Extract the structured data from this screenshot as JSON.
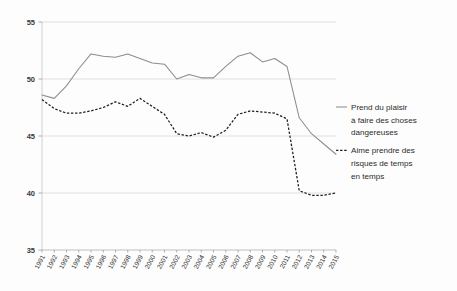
{
  "chart_data": {
    "type": "line",
    "title": "",
    "subtitle": "",
    "xlabel": "",
    "ylabel": "",
    "grid": true,
    "legend_position": "right",
    "ylim": [
      35,
      55
    ],
    "yticks": [
      35,
      40,
      45,
      50,
      55
    ],
    "ytick_labels": [
      "35",
      "40",
      "45",
      "50",
      "55"
    ],
    "x": [
      1991,
      1992,
      1993,
      1994,
      1995,
      1996,
      1997,
      1998,
      1999,
      2000,
      2001,
      2002,
      2003,
      2004,
      2005,
      2006,
      2007,
      2008,
      2009,
      2010,
      2011,
      2012,
      2013,
      2014,
      2015
    ],
    "xtick_labels": [
      "1991",
      "1992",
      "1993",
      "1994",
      "1995",
      "1996",
      "1997",
      "1998",
      "1999",
      "2000",
      "2001",
      "2002",
      "2003",
      "2004",
      "2005",
      "2006",
      "2007",
      "2008",
      "2009",
      "2010",
      "2011",
      "2012",
      "2013",
      "2014",
      "2015"
    ],
    "series": [
      {
        "name": "Prend du plaisir à faire des choses dangereuses",
        "style": "solid",
        "color": "#8d8d8d",
        "values": [
          48.6,
          48.3,
          49.4,
          50.9,
          52.2,
          52.0,
          51.9,
          52.2,
          51.8,
          51.4,
          51.3,
          50.0,
          50.4,
          50.1,
          50.1,
          51.1,
          52.0,
          52.3,
          51.5,
          51.8,
          51.1,
          46.6,
          45.2,
          44.3,
          43.4
        ]
      },
      {
        "name": "Aime prendre des risques de temps en temps",
        "style": "dashed",
        "color": "#1d1d1d",
        "values": [
          48.2,
          47.4,
          47.0,
          47.0,
          47.2,
          47.5,
          48.0,
          47.6,
          48.3,
          47.6,
          46.9,
          45.2,
          45.0,
          45.3,
          44.9,
          45.5,
          46.9,
          47.2,
          47.1,
          47.0,
          46.5,
          40.2,
          39.8,
          39.8,
          40.0
        ]
      }
    ]
  },
  "legend": {
    "entries": [
      {
        "label_lines": [
          "Prend du plaisir",
          "à faire des choses",
          "dangereuses"
        ],
        "marker": "solid-line-swatch"
      },
      {
        "label_lines": [
          "Aime prendre des",
          "risques de temps",
          "en temps"
        ],
        "marker": "dashed-line-swatch"
      }
    ]
  },
  "colors": {
    "series_solid": "#8d8d8d",
    "series_dashed": "#1d1d1d",
    "gridline": "#d7d7d7",
    "background": "#fdfdfd"
  }
}
